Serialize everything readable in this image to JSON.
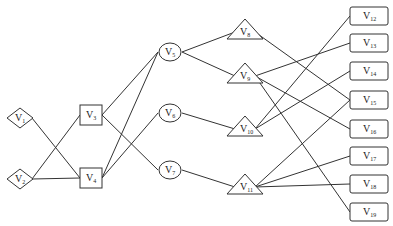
{
  "diagram": {
    "type": "layered directed graph",
    "nodes": [
      {
        "id": "V1",
        "base": "V",
        "sub": "1",
        "shape": "diamond",
        "x": 20,
        "y": 118
      },
      {
        "id": "V2",
        "base": "V",
        "sub": "2",
        "shape": "diamond",
        "x": 20,
        "y": 179
      },
      {
        "id": "V3",
        "base": "V",
        "sub": "3",
        "shape": "rect",
        "x": 91,
        "y": 115
      },
      {
        "id": "V4",
        "base": "V",
        "sub": "4",
        "shape": "rect",
        "x": 91,
        "y": 178
      },
      {
        "id": "V5",
        "base": "V",
        "sub": "5",
        "shape": "ellipse",
        "x": 170,
        "y": 52
      },
      {
        "id": "V6",
        "base": "V",
        "sub": "6",
        "shape": "ellipse",
        "x": 170,
        "y": 113
      },
      {
        "id": "V7",
        "base": "V",
        "sub": "7",
        "shape": "ellipse",
        "x": 170,
        "y": 170
      },
      {
        "id": "V8",
        "base": "V",
        "sub": "8",
        "shape": "triangle",
        "x": 245,
        "y": 30
      },
      {
        "id": "V9",
        "base": "V",
        "sub": "9",
        "shape": "triangle",
        "x": 245,
        "y": 74
      },
      {
        "id": "V10",
        "base": "V",
        "sub": "10",
        "shape": "triangle",
        "x": 245,
        "y": 127
      },
      {
        "id": "V11",
        "base": "V",
        "sub": "11",
        "shape": "triangle",
        "x": 245,
        "y": 185
      },
      {
        "id": "V12",
        "base": "V",
        "sub": "12",
        "shape": "roundrect",
        "x": 369,
        "y": 16
      },
      {
        "id": "V13",
        "base": "V",
        "sub": "13",
        "shape": "roundrect",
        "x": 369,
        "y": 43
      },
      {
        "id": "V14",
        "base": "V",
        "sub": "14",
        "shape": "roundrect",
        "x": 369,
        "y": 71
      },
      {
        "id": "V15",
        "base": "V",
        "sub": "15",
        "shape": "roundrect",
        "x": 369,
        "y": 100
      },
      {
        "id": "V16",
        "base": "V",
        "sub": "16",
        "shape": "roundrect",
        "x": 369,
        "y": 129
      },
      {
        "id": "V17",
        "base": "V",
        "sub": "17",
        "shape": "roundrect",
        "x": 369,
        "y": 156
      },
      {
        "id": "V18",
        "base": "V",
        "sub": "18",
        "shape": "roundrect",
        "x": 369,
        "y": 184
      },
      {
        "id": "V19",
        "base": "V",
        "sub": "19",
        "shape": "roundrect",
        "x": 369,
        "y": 212
      }
    ],
    "edges": [
      [
        "V1",
        "V4"
      ],
      [
        "V2",
        "V3"
      ],
      [
        "V2",
        "V4"
      ],
      [
        "V3",
        "V5"
      ],
      [
        "V3",
        "V7"
      ],
      [
        "V4",
        "V5"
      ],
      [
        "V4",
        "V6"
      ],
      [
        "V5",
        "V8"
      ],
      [
        "V5",
        "V9"
      ],
      [
        "V6",
        "V10"
      ],
      [
        "V7",
        "V11"
      ],
      [
        "V8",
        "V15"
      ],
      [
        "V9",
        "V13"
      ],
      [
        "V9",
        "V16"
      ],
      [
        "V9",
        "V19"
      ],
      [
        "V10",
        "V12"
      ],
      [
        "V10",
        "V14"
      ],
      [
        "V11",
        "V15"
      ],
      [
        "V11",
        "V17"
      ],
      [
        "V11",
        "V18"
      ]
    ]
  }
}
